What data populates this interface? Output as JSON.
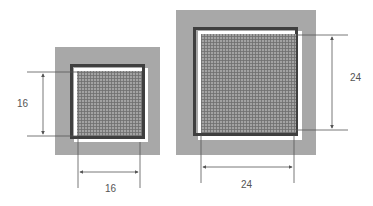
{
  "diagram": {
    "type": "dimensioned-square-comparison",
    "colors": {
      "outer_field": "#a8a8a8",
      "frame": "#3f3f3f",
      "inner_highlight": "#ffffff",
      "grid_fill": "#9a9a9a",
      "grid_line": "#6e6e6e",
      "dimension_line": "#555555",
      "label": "#555555"
    },
    "squares": [
      {
        "id": "small",
        "height_label": "16",
        "width_label": "16"
      },
      {
        "id": "large",
        "height_label": "24",
        "width_label": "24"
      }
    ]
  }
}
